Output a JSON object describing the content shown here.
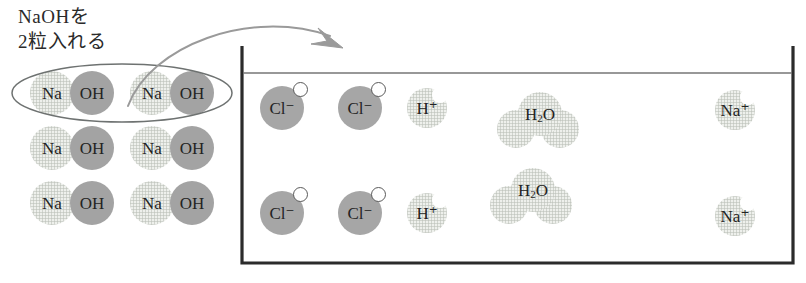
{
  "caption": {
    "line1": "NaOHを",
    "line2": "2粒入れる"
  },
  "colors": {
    "pale_fill": "#eef0ec",
    "solid_fill": "#a6a6a6",
    "oh_fill": "#a3a3a3",
    "outline": "#6e7271",
    "beaker_stroke": "#2b2b2b",
    "water_line": "#767676",
    "arrow": "#9a9a9a",
    "text": "#232323"
  },
  "arrow": {
    "name": "pour-arrow",
    "from_label": "NaOH group",
    "to_label": "beaker"
  },
  "highlight_ellipse": {
    "name": "selection-ellipse",
    "encloses": "top row NaOH pair group"
  },
  "naoh_group": {
    "label": "NaOH solid grains",
    "rows": [
      {
        "highlighted": true,
        "pairs": [
          {
            "cation": "Na",
            "anion": "OH"
          },
          {
            "cation": "Na",
            "anion": "OH"
          }
        ]
      },
      {
        "highlighted": false,
        "pairs": [
          {
            "cation": "Na",
            "anion": "OH"
          },
          {
            "cation": "Na",
            "anion": "OH"
          }
        ]
      },
      {
        "highlighted": false,
        "pairs": [
          {
            "cation": "Na",
            "anion": "OH"
          },
          {
            "cation": "Na",
            "anion": "OH"
          }
        ]
      }
    ]
  },
  "beaker": {
    "name": "beaker",
    "has_water_line": true,
    "contents": {
      "row_upper": [
        {
          "kind": "chloride",
          "label": "Cl⁻"
        },
        {
          "kind": "chloride",
          "label": "Cl⁻"
        },
        {
          "kind": "hydrogen",
          "label": "H⁺"
        },
        {
          "kind": "water",
          "label_main": "H",
          "label_sub": "2",
          "label_tail": "O"
        },
        {
          "kind": "sodium",
          "label": "Na⁺"
        }
      ],
      "row_lower": [
        {
          "kind": "chloride",
          "label": "Cl⁻"
        },
        {
          "kind": "chloride",
          "label": "Cl⁻"
        },
        {
          "kind": "hydrogen",
          "label": "H⁺"
        },
        {
          "kind": "water",
          "label_main": "H",
          "label_sub": "2",
          "label_tail": "O"
        },
        {
          "kind": "sodium",
          "label": "Na⁺"
        }
      ]
    }
  }
}
